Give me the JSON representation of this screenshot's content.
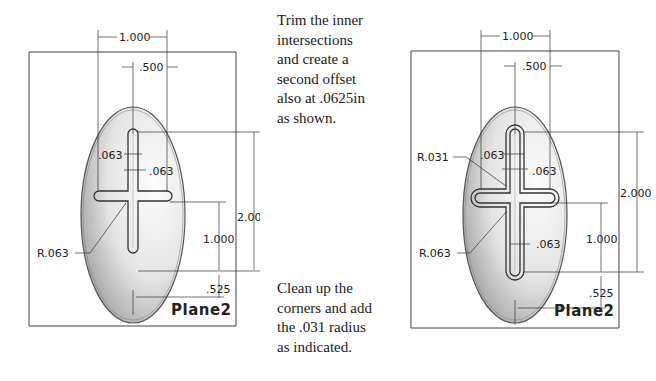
{
  "figure_left": {
    "plane_label": "Plane2",
    "dims": {
      "width_outer": "1.000",
      "width_inner": ".500",
      "offset_a": ".063",
      "offset_b": ".063",
      "height_total": "2.000",
      "height_lower": "1.000",
      "bottom_offset": ".525",
      "radius": "R.063"
    }
  },
  "caption_top": {
    "lines": [
      "Trim the inner",
      "intersections",
      "and create a",
      "second offset",
      "also at .0625in",
      "as shown."
    ]
  },
  "caption_bottom": {
    "lines": [
      "Clean up the",
      "corners and add",
      "the .031 radius",
      "as indicated."
    ]
  },
  "figure_right": {
    "plane_label": "Plane2",
    "dims": {
      "width_outer": "1.000",
      "width_inner": ".500",
      "offset_a": ".063",
      "offset_b": ".063",
      "offset_c": ".063",
      "height_total": "2.000",
      "height_lower": "1.000",
      "bottom_offset": ".525",
      "radius_small": "R.031",
      "radius": "R.063"
    }
  }
}
